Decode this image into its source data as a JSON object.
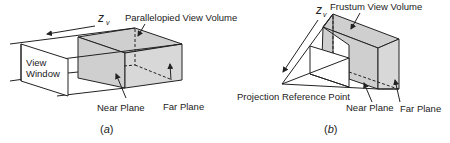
{
  "figure_a": {
    "axis_label": "z",
    "axis_subscript": "v",
    "title": "Parallelopied View Volume",
    "view_window_line1": "View",
    "view_window_line2": "Window",
    "near_plane": "Near Plane",
    "far_plane": "Far Plane",
    "caption_open": "(",
    "caption_letter": "a",
    "caption_close": ")"
  },
  "figure_b": {
    "axis_label": "z",
    "axis_subscript": "v",
    "title": "Frustum View Volume",
    "prp": "Projection Reference Point",
    "near_plane": "Near Plane",
    "far_plane": "Far Plane",
    "caption_open": "(",
    "caption_letter": "b",
    "caption_close": ")"
  },
  "colors": {
    "line": "#222222",
    "volume_fill": "#cfcfcf",
    "background": "#ffffff"
  }
}
